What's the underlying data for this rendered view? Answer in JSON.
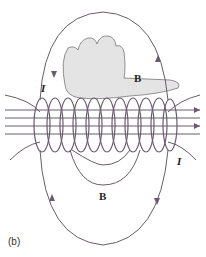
{
  "labels": {
    "B_top": "B",
    "B_bottom": "B",
    "I_left": "I",
    "I_right": "I",
    "caption": "(b)"
  },
  "colors": {
    "field_line": "#6b5a6e",
    "coil": "#6b5a6e",
    "hand": "#d9d9d9"
  }
}
